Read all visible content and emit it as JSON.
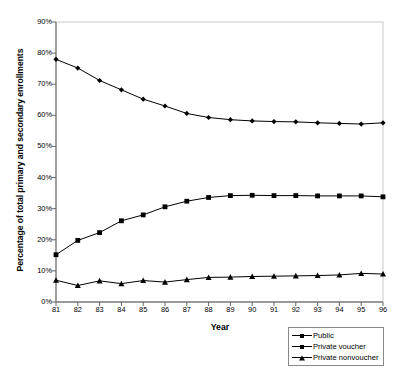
{
  "chart_data": {
    "type": "line",
    "title": "",
    "xlabel": "Year",
    "ylabel": "Percentage of total primary and secondary enrollments",
    "x": [
      81,
      82,
      83,
      84,
      85,
      86,
      87,
      88,
      89,
      90,
      91,
      92,
      93,
      94,
      95,
      96
    ],
    "xticklabels": [
      "81",
      "82",
      "83",
      "84",
      "85",
      "86",
      "87",
      "88",
      "89",
      "90",
      "91",
      "92",
      "93",
      "94",
      "95",
      "96"
    ],
    "yticklabels": [
      "0%",
      "10%",
      "20%",
      "30%",
      "40%",
      "50%",
      "60%",
      "70%",
      "80%",
      "90%"
    ],
    "yticks": [
      0,
      10,
      20,
      30,
      40,
      50,
      60,
      70,
      80,
      90
    ],
    "ylim": [
      0,
      90
    ],
    "xlim": [
      81,
      96
    ],
    "grid": false,
    "legend_position": "bottom-right",
    "series": [
      {
        "name": "Public",
        "marker": "diamond",
        "color": "#000000",
        "values": [
          78.0,
          75.2,
          71.2,
          68.2,
          65.2,
          63.0,
          60.6,
          59.3,
          58.6,
          58.2,
          58.0,
          57.9,
          57.6,
          57.4,
          57.2,
          57.6
        ]
      },
      {
        "name": "Private voucher",
        "marker": "square",
        "color": "#000000",
        "values": [
          15.2,
          19.8,
          22.3,
          26.1,
          28.0,
          30.6,
          32.4,
          33.6,
          34.2,
          34.3,
          34.2,
          34.2,
          34.1,
          34.1,
          34.1,
          33.8
        ]
      },
      {
        "name": "Private nonvoucher",
        "marker": "triangle",
        "color": "#000000",
        "values": [
          7.0,
          5.3,
          6.8,
          5.9,
          6.9,
          6.4,
          7.2,
          7.9,
          8.0,
          8.2,
          8.3,
          8.4,
          8.5,
          8.7,
          9.2,
          9.0
        ]
      }
    ]
  },
  "legend": {
    "items": [
      {
        "label": "Public",
        "marker": "diamond"
      },
      {
        "label": "Private voucher",
        "marker": "square"
      },
      {
        "label": "Private nonvoucher",
        "marker": "triangle"
      }
    ]
  }
}
